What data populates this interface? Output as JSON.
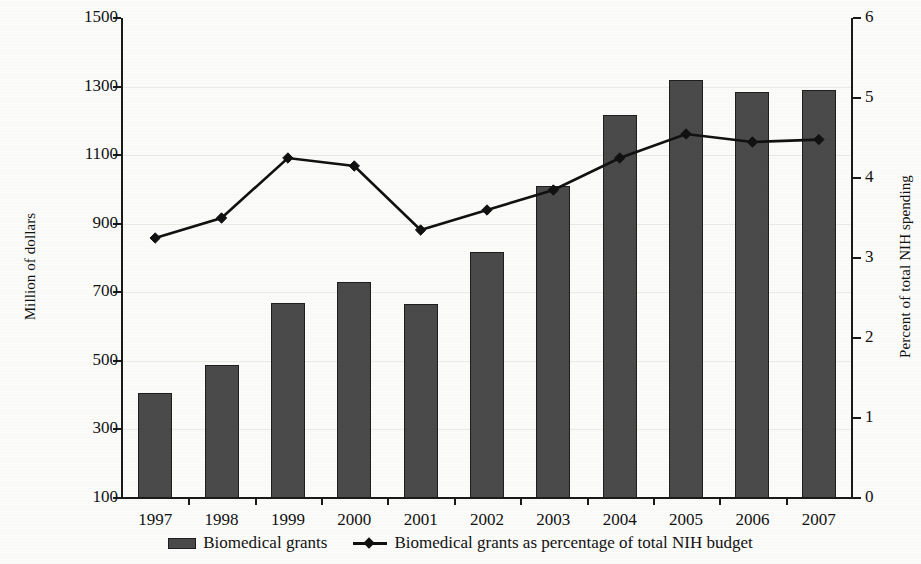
{
  "chart_data": {
    "type": "bar",
    "title": "",
    "subtitle": "",
    "categories": [
      "1997",
      "1998",
      "1999",
      "2000",
      "2001",
      "2002",
      "2003",
      "2004",
      "2005",
      "2006",
      "2007"
    ],
    "xlabel": "",
    "ylabel": "Million of dollars",
    "y2label": "Percent of total NIH spending",
    "ylim": [
      100,
      1500
    ],
    "y2lim": [
      0,
      6
    ],
    "yticks": [
      100,
      300,
      500,
      700,
      900,
      1100,
      1300,
      1500
    ],
    "y2ticks": [
      0,
      1,
      2,
      3,
      4,
      5,
      6
    ],
    "grid": true,
    "legend_position": "bottom",
    "series": [
      {
        "name": "Biomedical grants",
        "type": "bar",
        "axis": "left",
        "unit": "Million of dollars",
        "values": [
          405,
          487,
          668,
          730,
          665,
          818,
          1010,
          1218,
          1318,
          1285,
          1290
        ]
      },
      {
        "name": "Biomedical grants as percentage of total NIH budget",
        "type": "line",
        "axis": "right",
        "unit": "Percent",
        "values": [
          3.25,
          3.5,
          4.25,
          4.15,
          3.35,
          3.6,
          3.85,
          4.25,
          4.55,
          4.45,
          4.48
        ]
      }
    ]
  },
  "axes": {
    "left_title": "Million of dollars",
    "right_title": "Percent of total NIH spending",
    "left_ticklabels": [
      "1500",
      "1300",
      "1100",
      "900",
      "700",
      "500",
      "300",
      "100"
    ],
    "right_ticklabels": [
      "6",
      "5",
      "4",
      "3",
      "2",
      "1",
      "0"
    ],
    "x_ticklabels": [
      "1997",
      "1998",
      "1999",
      "2000",
      "2001",
      "2002",
      "2003",
      "2004",
      "2005",
      "2006",
      "2007"
    ]
  },
  "legend": {
    "items": [
      {
        "label": "Biomedical grants",
        "marker": "bar-swatch",
        "color": "#4a4a4a"
      },
      {
        "label": "Biomedical grants as percentage of total NIH budget",
        "marker": "line-diamond",
        "color": "#111111"
      }
    ]
  },
  "colors": {
    "bar_fill": "#4a4a4a",
    "bar_edge": "#1e1e1e",
    "line": "#111111",
    "grid": "#eceae4",
    "background": "#fbfbf9"
  }
}
